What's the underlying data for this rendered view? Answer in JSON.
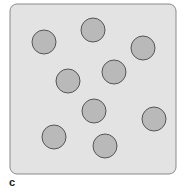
{
  "figure": {
    "panel_label": "c",
    "colors": {
      "box_fill": "#e3e3e3",
      "box_stroke": "#8a8a8a",
      "particle_fill": "#b9b9b9",
      "particle_stroke": "#555555"
    },
    "particle_count": 9
  }
}
